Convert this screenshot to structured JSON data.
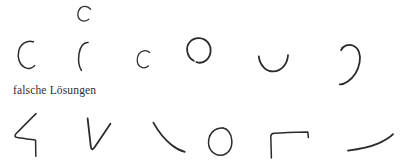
{
  "page": {
    "width": 403,
    "height": 168,
    "background_color": "#ffffff",
    "ink_color": "#2b2b2b"
  },
  "model_letter": {
    "name": "model-letter-c",
    "character": "C",
    "description": "small printed model letter C at top",
    "x": 78,
    "y": 6,
    "width": 13,
    "height": 15
  },
  "caption": {
    "text": "falsche Lösungen",
    "language": "de",
    "translation_hint": "wrong solutions",
    "x": 13,
    "y": 84
  },
  "rows": [
    {
      "name": "row-correct-attempts",
      "label": "",
      "y": 38,
      "shapes": [
        {
          "name": "shape-c-open-left",
          "glyph": "C",
          "description": "open C arc facing right"
        },
        {
          "name": "shape-narrow-paren",
          "glyph": "(",
          "description": "narrow vertical arc like open parenthesis"
        },
        {
          "name": "shape-small-c",
          "glyph": "c",
          "description": "small C arc"
        },
        {
          "name": "shape-near-closed-circle",
          "glyph": "◠",
          "description": "nearly closed circle with gap at lower left"
        },
        {
          "name": "shape-u-bowl",
          "glyph": "◡",
          "description": "shallow U bowl, C rotated ninety degrees"
        },
        {
          "name": "shape-reversed-c",
          "glyph": ")",
          "description": "mirrored C hook facing left"
        }
      ]
    },
    {
      "name": "row-wrong-solutions",
      "label": "falsche Lösungen",
      "y": 112,
      "shapes": [
        {
          "name": "shape-angular-hook",
          "glyph": "⌐",
          "description": "diagonal stroke into horizontal then down tick"
        },
        {
          "name": "shape-v",
          "glyph": "V",
          "description": "V shape, down stroke then up-right diagonal"
        },
        {
          "name": "shape-diagonal-curve",
          "glyph": "\\",
          "description": "single curved diagonal stroke"
        },
        {
          "name": "shape-closed-o",
          "glyph": "O",
          "description": "closed circle"
        },
        {
          "name": "shape-bracket",
          "glyph": "⌐",
          "description": "vertical up, horizontal right, short down tick"
        },
        {
          "name": "shape-flat-tail",
          "glyph": "—",
          "description": "shallow horizontal stroke curving up at right"
        }
      ]
    }
  ]
}
